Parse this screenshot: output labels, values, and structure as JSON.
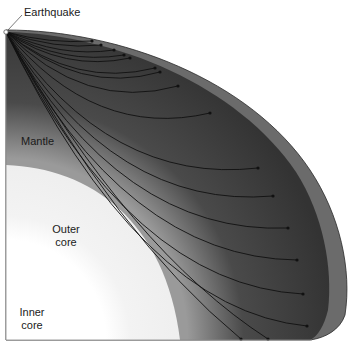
{
  "diagram": {
    "labels": {
      "earthquake": "Earthquake",
      "mantle": "Mantle",
      "outer_core": [
        "Outer",
        "core"
      ],
      "inner_core": [
        "Inner",
        "core"
      ]
    },
    "layers": [
      {
        "name": "crust",
        "color": "#6e6e6e"
      },
      {
        "name": "mantle",
        "color": "#3a3a3a"
      },
      {
        "name": "outer-core",
        "color": "#f2f2f2"
      },
      {
        "name": "inner-core",
        "color": "#ffffff"
      }
    ],
    "earthquake_origin": [
      6,
      32
    ],
    "ray_endpoints": [
      [
        92,
        41
      ],
      [
        101,
        45
      ],
      [
        114,
        50
      ],
      [
        124,
        55
      ],
      [
        130,
        58
      ],
      [
        155,
        68
      ],
      [
        160,
        72
      ],
      [
        178,
        86
      ],
      [
        210,
        113
      ],
      [
        258,
        168
      ],
      [
        273,
        196
      ],
      [
        288,
        228
      ],
      [
        297,
        260
      ],
      [
        303,
        294
      ],
      [
        307,
        326
      ],
      [
        268,
        339
      ],
      [
        241,
        339
      ]
    ]
  }
}
